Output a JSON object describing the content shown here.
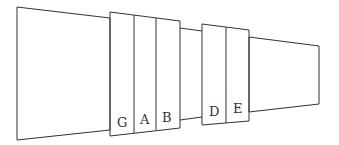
{
  "diagram": {
    "type": "stepped-channel-with-blocks",
    "stroke_color": "#333333",
    "background": "#ffffff",
    "labels": {
      "G": "G",
      "A": "A",
      "B": "B",
      "D": "D",
      "E": "E"
    },
    "block_groups": [
      {
        "name": "group-1",
        "segments": [
          "G",
          "A",
          "B"
        ]
      },
      {
        "name": "group-2",
        "segments": [
          "D",
          "E"
        ]
      }
    ]
  }
}
